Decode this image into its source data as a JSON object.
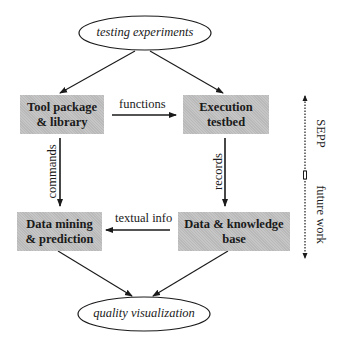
{
  "diagram": {
    "nodes": {
      "testing_experiments": "testing experiments",
      "tool_package": [
        "Tool package",
        "& library"
      ],
      "execution_testbed": [
        "Execution",
        "testbed"
      ],
      "data_mining": [
        "Data mining",
        "& prediction"
      ],
      "data_knowledge": [
        "Data & knowledge",
        "base"
      ],
      "quality_visualization": "quality visualization"
    },
    "edges": {
      "functions": "functions",
      "commands": "commands",
      "records": "records",
      "textual_info": "textual info"
    },
    "side_indicator": {
      "upper": "SEPP",
      "lower": "future work"
    },
    "colors": {
      "box_fill": "#b9b9b9",
      "stroke": "#1a1a1a",
      "background": "#ffffff"
    }
  }
}
